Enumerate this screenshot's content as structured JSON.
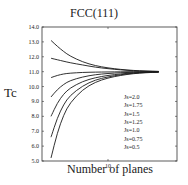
{
  "chart_data": {
    "type": "line",
    "title": "FCC(111)",
    "xlabel": "Number of planes",
    "ylabel": "Tc",
    "xlim": [
      0,
      20
    ],
    "ylim": [
      5.0,
      14.0
    ],
    "x_ticks": [
      {
        "value": 10,
        "label": "10"
      }
    ],
    "y_ticks": [
      "5.0",
      "6.0",
      "7.0",
      "8.0",
      "9.0",
      "10.0",
      "11.0",
      "12.0",
      "13.0",
      "14.0"
    ],
    "grid": false,
    "legend_position": "right-inside",
    "x": [
      1,
      2,
      3,
      4,
      6,
      8,
      10,
      12,
      14,
      16,
      18
    ],
    "series": [
      {
        "name": "Js=2.0",
        "values": [
          13.1,
          12.7,
          12.35,
          12.05,
          11.65,
          11.4,
          11.25,
          11.15,
          11.08,
          11.04,
          11.02
        ]
      },
      {
        "name": "Js=1.75",
        "values": [
          11.9,
          11.8,
          11.7,
          11.6,
          11.45,
          11.3,
          11.2,
          11.12,
          11.06,
          11.03,
          11.01
        ]
      },
      {
        "name": "Js=1.5",
        "values": [
          10.6,
          10.75,
          10.85,
          10.9,
          10.95,
          10.97,
          10.98,
          10.99,
          11.0,
          11.0,
          11.0
        ]
      },
      {
        "name": "Js=1.25",
        "values": [
          9.3,
          9.8,
          10.15,
          10.4,
          10.65,
          10.8,
          10.88,
          10.93,
          10.96,
          10.98,
          10.99
        ]
      },
      {
        "name": "Js=1.0",
        "values": [
          8.0,
          8.9,
          9.5,
          9.9,
          10.35,
          10.6,
          10.75,
          10.85,
          10.92,
          10.96,
          10.98
        ]
      },
      {
        "name": "Js=0.75",
        "values": [
          6.6,
          7.9,
          8.8,
          9.4,
          10.05,
          10.45,
          10.65,
          10.8,
          10.9,
          10.95,
          10.97
        ]
      },
      {
        "name": "Js=0.5",
        "values": [
          5.2,
          6.9,
          8.1,
          8.9,
          9.8,
          10.3,
          10.58,
          10.75,
          10.87,
          10.93,
          10.97
        ]
      }
    ]
  },
  "labels": {
    "title": "FCC(111)",
    "ylabel": "Tc",
    "xlabel": "Number of planes"
  }
}
